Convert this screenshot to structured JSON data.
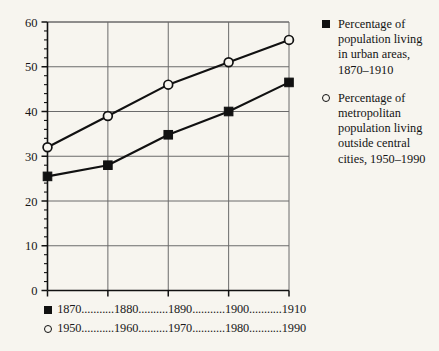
{
  "chart_data": {
    "type": "line",
    "title": "",
    "xlabel": "",
    "ylabel": "",
    "ylim": [
      0,
      60
    ],
    "yticks": [
      0,
      10,
      20,
      30,
      40,
      50,
      60
    ],
    "ytick_labels": [
      "0",
      "10",
      "20",
      "30",
      "40",
      "50",
      "60"
    ],
    "y_minor_step": 2,
    "grid": true,
    "legend_position": "right",
    "x_positions": [
      0,
      1,
      2,
      3,
      4
    ],
    "series": [
      {
        "name": "Percentage of population living in urban areas, 1870–1910",
        "marker": "filled-square",
        "categories": [
          "1870",
          "1880",
          "1890",
          "1900",
          "1910"
        ],
        "values": [
          25.5,
          28,
          34.8,
          40,
          46.5
        ]
      },
      {
        "name": "Percentage of metropolitan population living outside central cities, 1950–1990",
        "marker": "open-circle",
        "categories": [
          "1950",
          "1960",
          "1970",
          "1980",
          "1990"
        ],
        "values": [
          32,
          39,
          46,
          51,
          56
        ]
      }
    ]
  },
  "legend": {
    "entries": [
      {
        "marker": "filled-square",
        "text": "Percentage of population living in urban areas, 1870–1910"
      },
      {
        "marker": "open-circle",
        "text": "Percentage of metropolitan population living outside central cities, 1950–1990"
      }
    ]
  },
  "x_axis_rows": [
    {
      "marker": "filled-square",
      "years": "1870...........1880..........1890...........1900...........1910"
    },
    {
      "marker": "open-circle",
      "years": "1950...........1960..........1970...........1980...........1990"
    }
  ],
  "colors": {
    "background": "#f7f5ef",
    "ink": "#111111",
    "grid": "#6b6b6b",
    "axis": "#111111"
  }
}
